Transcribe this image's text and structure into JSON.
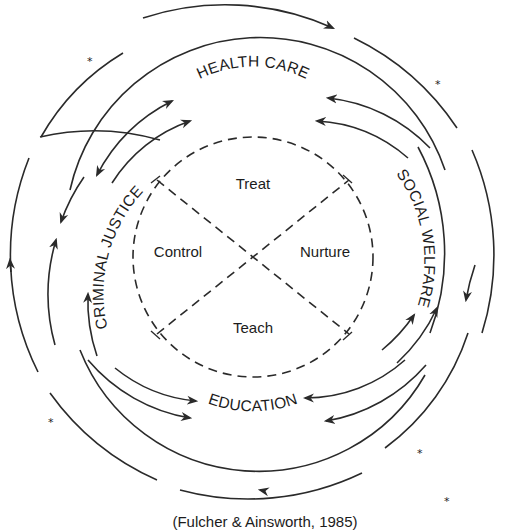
{
  "diagram": {
    "ring_labels": {
      "top": "HEALTH CARE",
      "right": "SOCIAL WELFARE",
      "bottom": "EDUCATION",
      "left": "CRIMINAL JUSTICE"
    },
    "inner_sectors": {
      "top": "Treat",
      "right": "Nurture",
      "bottom": "Teach",
      "left": "Control"
    },
    "caption": "(Fulcher & Ainsworth, 1985)",
    "marker_symbol": "*",
    "colors": {
      "line": "#2a2a2a",
      "text": "#1c1c1c",
      "background": "#ffffff"
    }
  }
}
